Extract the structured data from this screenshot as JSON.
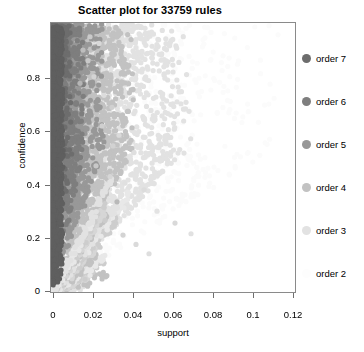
{
  "chart_data": {
    "type": "scatter",
    "title": "Scatter plot for 33759 rules",
    "xlabel": "support",
    "ylabel": "confidence",
    "xlim": [
      0,
      0.12
    ],
    "ylim": [
      0,
      1.0
    ],
    "grid": false,
    "x_ticks": [
      {
        "value": 0,
        "label": "0"
      },
      {
        "value": 0.02,
        "label": "0.02"
      },
      {
        "value": 0.04,
        "label": "0.04"
      },
      {
        "value": 0.06,
        "label": "0.06"
      },
      {
        "value": 0.08,
        "label": "0.08"
      },
      {
        "value": 0.1,
        "label": "0.1"
      },
      {
        "value": 0.12,
        "label": "0.12"
      }
    ],
    "y_ticks": [
      {
        "value": 0,
        "label": "0"
      },
      {
        "value": 0.2,
        "label": "0.2"
      },
      {
        "value": 0.4,
        "label": "0.4"
      },
      {
        "value": 0.6,
        "label": "0.6"
      },
      {
        "value": 0.8,
        "label": "0.8"
      }
    ],
    "n_points": 33759,
    "point_shape": "circle",
    "point_radius_px": 2.6,
    "legend_position": "right",
    "legend_title": "",
    "series": [
      {
        "name": "order 7",
        "color": "#6d6d6d",
        "gray": 109,
        "fraction": 0.04,
        "x_max": 0.01,
        "y_min": 0.3
      },
      {
        "name": "order 6",
        "color": "#7e7e7e",
        "gray": 126,
        "fraction": 0.1,
        "x_max": 0.016,
        "y_min": 0.22
      },
      {
        "name": "order 5",
        "color": "#989898",
        "gray": 152,
        "fraction": 0.19,
        "x_max": 0.026,
        "y_min": 0.14
      },
      {
        "name": "order 4",
        "color": "#c2c2c2",
        "gray": 194,
        "fraction": 0.26,
        "x_max": 0.042,
        "y_min": 0.07
      },
      {
        "name": "order 3",
        "color": "#e2e2e2",
        "gray": 226,
        "fraction": 0.28,
        "x_max": 0.07,
        "y_min": 0.03
      },
      {
        "name": "order 2",
        "color": "#fbfbfb",
        "gray": 251,
        "fraction": 0.13,
        "x_max": 0.115,
        "y_min": 0.01
      }
    ],
    "cloud_description": "Dense wedge of points hugging the support=0 axis, spanning confidence 0 to 1; density decays sharply with increasing support; darker (higher order) rules concentrate at low support and high confidence; faint radiating rays fan out from the origin in the low-confidence region; a few isolated light points extend to support 0.06-0.07."
  },
  "legend": {
    "items": [
      {
        "label": "order 7",
        "color": "#6d6d6d",
        "top": 28
      },
      {
        "label": "order 6",
        "color": "#7e7e7e",
        "top": 71
      },
      {
        "label": "order 5",
        "color": "#989898",
        "top": 114
      },
      {
        "label": "order 4",
        "color": "#c2c2c2",
        "top": 157
      },
      {
        "label": "order 3",
        "color": "#e2e2e2",
        "top": 200
      },
      {
        "label": "order 2",
        "color": "#fdfdfd",
        "top": 243
      }
    ]
  }
}
